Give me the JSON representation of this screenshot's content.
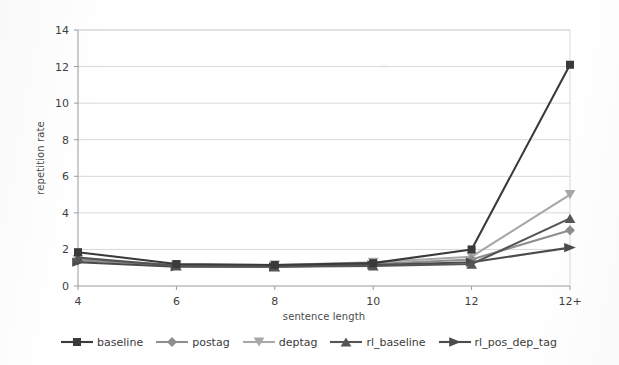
{
  "chart_data": {
    "type": "line",
    "title": "",
    "subtitle": "",
    "xlabel": "sentence length",
    "ylabel": "repetition rate",
    "categories": [
      "4",
      "6",
      "8",
      "10",
      "12",
      "12+"
    ],
    "xlim": [
      0,
      5
    ],
    "ylim": [
      0,
      14
    ],
    "ytick_step": 2,
    "yticks": [
      "0",
      "2",
      "4",
      "6",
      "8",
      "10",
      "12",
      "14"
    ],
    "grid": "horizontal",
    "legend_position": "bottom",
    "series": [
      {
        "name": "baseline",
        "marker": "square",
        "color": "#3a3a3a",
        "values": [
          1.85,
          1.2,
          1.15,
          1.25,
          2.0,
          12.1
        ]
      },
      {
        "name": "postag",
        "marker": "diamond",
        "color": "#8e8e8e",
        "values": [
          1.4,
          1.15,
          1.1,
          1.2,
          1.45,
          3.05
        ]
      },
      {
        "name": "deptag",
        "marker": "triangle-down",
        "color": "#a8a8a8",
        "values": [
          1.45,
          1.15,
          1.15,
          1.3,
          1.6,
          5.0
        ]
      },
      {
        "name": "rl_baseline",
        "marker": "triangle-up",
        "color": "#555555",
        "values": [
          1.55,
          1.1,
          1.05,
          1.1,
          1.2,
          3.7
        ]
      },
      {
        "name": "rl_pos_dep_tag",
        "marker": "arrow-right",
        "color": "#4b4b4b",
        "values": [
          1.3,
          1.05,
          1.05,
          1.15,
          1.3,
          2.1
        ]
      }
    ],
    "colors": {
      "grid": "#d8d8d8",
      "axis": "#9a9a9a",
      "text": "#3f3f3f",
      "background": "#ffffff"
    }
  },
  "legend": {
    "items": [
      {
        "label": "baseline"
      },
      {
        "label": "postag"
      },
      {
        "label": "deptag"
      },
      {
        "label": "rl_baseline"
      },
      {
        "label": "rl_pos_dep_tag"
      }
    ]
  }
}
